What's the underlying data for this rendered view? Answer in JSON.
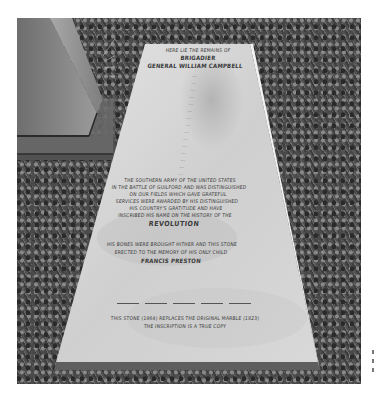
{
  "image": {
    "subject": "Grave slab with engraved inscription lying in grass beside a stone monument base",
    "palette": {
      "grass_dark": "#2e2e2e",
      "grass_light": "#8a8a8a",
      "stone_light": "#dcdcdc",
      "stone_mid": "#bdbdbd",
      "monument": "#7a7a7a",
      "engraving": "#3a3a3a"
    }
  },
  "inscription": {
    "header_line": "HERE LIE THE REMAINS OF",
    "rank": "BRIGADIER",
    "name_line": "GENERAL WILLIAM CAMPBELL",
    "body_lines": [
      "...",
      "...",
      "...",
      "...",
      "...",
      "...",
      "...",
      "...",
      "...",
      "...",
      "...",
      "...",
      "...",
      "...",
      "...",
      "THE SOUTHERN ARMY OF THE UNITED STATES",
      "IN THE BATTLE OF GUILFORD AND WAS DISTINGUISHED",
      "IN THE BATTLE OF GUILFORD AND WAS DISTINGUISHED",
      "ON OUR FIELDS WHICH GAVE GRATEFUL",
      "SERVICES WERE AWARDED BY HIS DISTINGUISHED",
      "HIS COUNTRY'S GRATITUDE AND HAVE",
      "INSCRIBED HIS NAME ON THE HISTORY OF THE"
    ],
    "revolution": "REVOLUTION",
    "dedication_lines": [
      "HIS BONES WERE BROUGHT HITHER AND THIS STONE",
      "ERECTED TO THE MEMORY OF HIS ONLY CHILD"
    ],
    "preston": "FRANCIS PRESTON",
    "footer_lines": [
      "THIS STONE (1964) REPLACES THE ORIGINAL MARBLE (1823)",
      "THE INSCRIPTION IS A TRUE COPY"
    ]
  }
}
